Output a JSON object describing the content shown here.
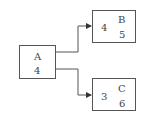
{
  "diagram": {
    "nodes": [
      {
        "id": "A",
        "label": "A",
        "value": "4"
      },
      {
        "id": "B",
        "label": "B",
        "value": "5",
        "incoming_value": "4"
      },
      {
        "id": "C",
        "label": "C",
        "value": "6",
        "incoming_value": "3"
      }
    ],
    "edges": [
      {
        "from": "A",
        "to": "B"
      },
      {
        "from": "A",
        "to": "C"
      }
    ],
    "colors": {
      "stroke": "#555555",
      "text": "#444444",
      "background": "#ffffff"
    }
  }
}
